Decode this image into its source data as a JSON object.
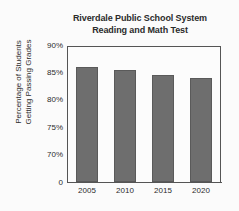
{
  "chart_data": {
    "type": "bar",
    "title": "Riverdale Public School System Reading and Math Test",
    "title_lines": [
      "Riverdale Public School System",
      "Reading and Math Test"
    ],
    "xlabel": "",
    "ylabel": "Percentage of Students Getting Passing Grades",
    "ylabel_lines": [
      "Percentage of Students",
      "Getting Passing Grades"
    ],
    "categories": [
      "2005",
      "2010",
      "2015",
      "2020"
    ],
    "values": [
      86.2,
      85.7,
      84.7,
      84.3
    ],
    "ylim": [
      70,
      90
    ],
    "y_axis_broken": true,
    "yticks": [
      90,
      85,
      80,
      75,
      70
    ],
    "ytick_labels": [
      "90%",
      "85%",
      "80%",
      "75%",
      "70%"
    ],
    "origin_label": "0",
    "grid": false,
    "legend": null,
    "series": [
      {
        "name": "Percentage Passing",
        "values": [
          86.2,
          85.7,
          84.7,
          84.3
        ]
      }
    ],
    "bar_color": "#6e6e6e",
    "axis_color": "#555555",
    "background_color": "#fbfbfb"
  }
}
